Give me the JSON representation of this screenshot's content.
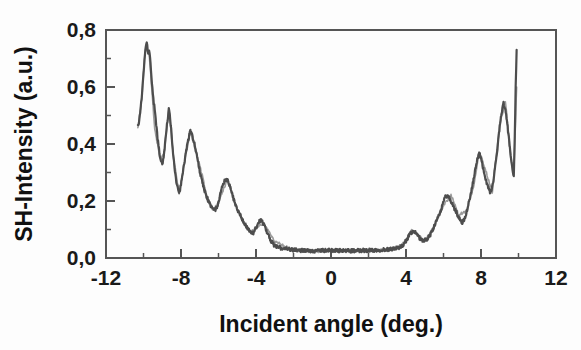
{
  "chart_data": {
    "type": "line",
    "title": "",
    "xlabel": "Incident angle (deg.)",
    "ylabel": "SH-Intensity (a.u.)",
    "xlim": [
      -12,
      12
    ],
    "ylim": [
      0.0,
      0.8
    ],
    "grid": false,
    "legend": null,
    "x_tick_labels": [
      "-12",
      "-8",
      "-4",
      "0",
      "4",
      "8",
      "12"
    ],
    "x_tick_values": [
      -12,
      -8,
      -4,
      0,
      4,
      8,
      12
    ],
    "x_minor_step": 2,
    "y_tick_labels": [
      "0,0",
      "0,2",
      "0,4",
      "0,6",
      "0,8"
    ],
    "y_tick_values": [
      0.0,
      0.2,
      0.4,
      0.6,
      0.8
    ],
    "y_minor_step": 0.1,
    "line_color": "#4d4d4d",
    "frame_color": "#555555",
    "background_color": "#fdfdfd",
    "series": [
      {
        "name": "SH intensity",
        "x": [
          -10.3,
          -10.25,
          -10.2,
          -10.15,
          -10.1,
          -10.05,
          -10.0,
          -9.95,
          -9.9,
          -9.85,
          -9.8,
          -9.75,
          -9.7,
          -9.65,
          -9.6,
          -9.55,
          -9.5,
          -9.45,
          -9.4,
          -9.35,
          -9.3,
          -9.25,
          -9.2,
          -9.15,
          -9.1,
          -9.05,
          -9.0,
          -8.95,
          -8.9,
          -8.85,
          -8.8,
          -8.75,
          -8.7,
          -8.65,
          -8.6,
          -8.55,
          -8.5,
          -8.45,
          -8.4,
          -8.35,
          -8.3,
          -8.25,
          -8.2,
          -8.15,
          -8.1,
          -8.05,
          -8.0,
          -7.9,
          -7.8,
          -7.7,
          -7.6,
          -7.5,
          -7.4,
          -7.3,
          -7.2,
          -7.1,
          -7.0,
          -6.9,
          -6.8,
          -6.7,
          -6.6,
          -6.5,
          -6.4,
          -6.3,
          -6.2,
          -6.1,
          -6.0,
          -5.9,
          -5.8,
          -5.7,
          -5.6,
          -5.5,
          -5.4,
          -5.3,
          -5.2,
          -5.1,
          -5.0,
          -4.9,
          -4.8,
          -4.7,
          -4.6,
          -4.5,
          -4.4,
          -4.3,
          -4.2,
          -4.1,
          -4.0,
          -3.9,
          -3.8,
          -3.7,
          -3.6,
          -3.4,
          -3.2,
          -3.0,
          -2.5,
          -2.0,
          -1.5,
          -1.0,
          -0.5,
          0.0,
          0.5,
          1.0,
          1.5,
          2.0,
          2.5,
          3.0,
          3.2,
          3.4,
          3.6,
          3.8,
          3.9,
          4.0,
          4.1,
          4.2,
          4.3,
          4.4,
          4.5,
          4.6,
          4.7,
          4.8,
          4.9,
          5.0,
          5.1,
          5.2,
          5.3,
          5.4,
          5.5,
          5.6,
          5.7,
          5.8,
          5.9,
          6.0,
          6.1,
          6.2,
          6.3,
          6.4,
          6.5,
          6.6,
          6.7,
          6.8,
          6.9,
          7.0,
          7.1,
          7.2,
          7.3,
          7.4,
          7.5,
          7.6,
          7.7,
          7.8,
          7.9,
          8.0,
          8.1,
          8.2,
          8.3,
          8.4,
          8.5,
          8.6,
          8.7,
          8.8,
          8.9,
          9.0,
          9.1,
          9.2,
          9.3,
          9.4,
          9.5,
          9.6,
          9.7,
          9.75,
          9.8,
          9.85,
          9.9
        ],
        "y": [
          0.47,
          0.475,
          0.5,
          0.53,
          0.56,
          0.6,
          0.645,
          0.69,
          0.725,
          0.755,
          0.745,
          0.715,
          0.73,
          0.7,
          0.66,
          0.61,
          0.575,
          0.545,
          0.52,
          0.49,
          0.455,
          0.42,
          0.395,
          0.37,
          0.35,
          0.335,
          0.33,
          0.345,
          0.37,
          0.4,
          0.435,
          0.465,
          0.49,
          0.52,
          0.505,
          0.47,
          0.43,
          0.39,
          0.355,
          0.32,
          0.29,
          0.268,
          0.25,
          0.238,
          0.232,
          0.24,
          0.26,
          0.3,
          0.345,
          0.385,
          0.42,
          0.445,
          0.43,
          0.405,
          0.375,
          0.34,
          0.305,
          0.275,
          0.25,
          0.228,
          0.21,
          0.195,
          0.18,
          0.172,
          0.168,
          0.175,
          0.195,
          0.225,
          0.25,
          0.268,
          0.278,
          0.27,
          0.255,
          0.232,
          0.208,
          0.188,
          0.172,
          0.158,
          0.145,
          0.132,
          0.12,
          0.11,
          0.1,
          0.092,
          0.086,
          0.09,
          0.105,
          0.12,
          0.132,
          0.13,
          0.12,
          0.09,
          0.06,
          0.042,
          0.032,
          0.028,
          0.026,
          0.025,
          0.026,
          0.027,
          0.026,
          0.025,
          0.026,
          0.027,
          0.028,
          0.03,
          0.032,
          0.034,
          0.036,
          0.04,
          0.048,
          0.06,
          0.072,
          0.082,
          0.09,
          0.092,
          0.088,
          0.08,
          0.072,
          0.066,
          0.062,
          0.062,
          0.066,
          0.072,
          0.082,
          0.095,
          0.11,
          0.125,
          0.14,
          0.155,
          0.175,
          0.2,
          0.215,
          0.22,
          0.21,
          0.198,
          0.185,
          0.172,
          0.158,
          0.145,
          0.132,
          0.125,
          0.135,
          0.155,
          0.18,
          0.21,
          0.24,
          0.275,
          0.31,
          0.345,
          0.37,
          0.35,
          0.32,
          0.29,
          0.265,
          0.245,
          0.23,
          0.25,
          0.29,
          0.34,
          0.4,
          0.46,
          0.51,
          0.545,
          0.52,
          0.47,
          0.41,
          0.35,
          0.3,
          0.29,
          0.42,
          0.6,
          0.73
        ]
      },
      {
        "name": "SH intensity (faint trace)",
        "x": [
          -10.3,
          -10.1,
          -10.0,
          -9.9,
          -9.7,
          -9.4,
          -9.1,
          -8.9,
          -8.65,
          -8.4,
          -8.1,
          -7.8,
          -7.5,
          -7.2,
          -6.9,
          -6.6,
          -6.3,
          -6.0,
          -5.7,
          -5.5,
          -5.2,
          -4.9,
          -4.6,
          -4.3,
          -4.0,
          -3.6,
          -3.0,
          -2.0,
          -1.0,
          0.0,
          1.0,
          2.0,
          3.0,
          3.6,
          4.0,
          4.3,
          4.6,
          5.0,
          5.4,
          5.8,
          6.0,
          6.4,
          6.8,
          7.2,
          7.6,
          7.9,
          8.2,
          8.6,
          9.0,
          9.3,
          9.6,
          9.75,
          9.9
        ],
        "y": [
          0.46,
          0.555,
          0.64,
          0.73,
          0.72,
          0.45,
          0.345,
          0.365,
          0.525,
          0.35,
          0.228,
          0.34,
          0.445,
          0.37,
          0.3,
          0.205,
          0.168,
          0.192,
          0.248,
          0.275,
          0.205,
          0.155,
          0.118,
          0.09,
          0.108,
          0.122,
          0.058,
          0.028,
          0.024,
          0.026,
          0.024,
          0.026,
          0.03,
          0.038,
          0.062,
          0.098,
          0.082,
          0.06,
          0.098,
          0.158,
          0.182,
          0.222,
          0.152,
          0.162,
          0.248,
          0.375,
          0.318,
          0.232,
          0.468,
          0.55,
          0.35,
          0.3,
          0.6
        ]
      }
    ]
  },
  "axes": {
    "x_title": "Incident angle (deg.)",
    "y_title": "SH-Intensity (a.u.)"
  }
}
